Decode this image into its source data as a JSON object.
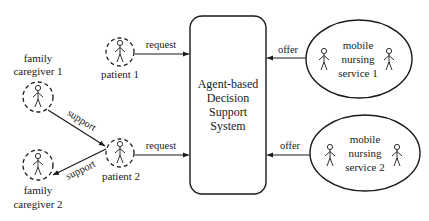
{
  "diagram": {
    "center_box": {
      "lines": [
        "Agent-based",
        "Decision",
        "Support",
        "System"
      ]
    },
    "actors": {
      "patient_1": {
        "label": "patient 1"
      },
      "patient_2": {
        "label": "patient 2"
      },
      "family_caregiver_1": {
        "label_lines": [
          "family",
          "caregiver 1"
        ]
      },
      "family_caregiver_2": {
        "label_lines": [
          "family",
          "caregiver 2"
        ]
      }
    },
    "services": {
      "service_1": {
        "lines": [
          "mobile",
          "nursing",
          "service 1"
        ]
      },
      "service_2": {
        "lines": [
          "mobile",
          "nursing",
          "service 2"
        ]
      }
    },
    "edges": {
      "request_1": "request",
      "request_2": "request",
      "offer_1": "offer",
      "offer_2": "offer",
      "support_1": "support",
      "support_2": "support"
    },
    "colors": {
      "stroke": "#1a1a1a",
      "background": "#ffffff"
    }
  }
}
